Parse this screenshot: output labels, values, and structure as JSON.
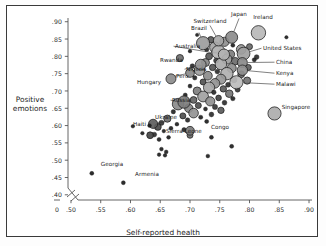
{
  "chart_data": {
    "type": "scatter",
    "title": "",
    "xlabel": "Self-reported health",
    "ylabel": "Positive emotions",
    "ylabel_line1": "Positive",
    "ylabel_line2": "emotions",
    "xlim": [
      0.485,
      0.905
    ],
    "ylim": [
      0.385,
      0.905
    ],
    "xticks": [
      "0",
      ".50",
      ".55",
      ".60",
      ".65",
      ".70",
      ".75",
      ".80",
      ".85",
      ".90"
    ],
    "xtick_values": [
      0.0,
      0.5,
      0.55,
      0.6,
      0.65,
      0.7,
      0.75,
      0.8,
      0.85,
      0.9
    ],
    "yticks": [
      ".90",
      ".85",
      ".80",
      ".75",
      ".70",
      ".65",
      ".60",
      ".55",
      ".50",
      ".45",
      ".40"
    ],
    "ytick_values": [
      0.9,
      0.85,
      0.8,
      0.75,
      0.7,
      0.65,
      0.6,
      0.55,
      0.5,
      0.45,
      0.4
    ],
    "grid": false,
    "legend": "none",
    "axis_break": true,
    "axis_break_note": "double-slash break between 0 and .50 on x axis",
    "marker_encoding": "bubble size encodes population; fill grayscale",
    "labeled_points": [
      {
        "name": "Ireland",
        "x": 0.815,
        "y": 0.868,
        "r": 7.2,
        "fill": "#b9b9b9",
        "lx": 263,
        "ly": 14,
        "lanchor": "center",
        "leader": false
      },
      {
        "name": "Japan",
        "x": 0.77,
        "y": 0.855,
        "r": 6.0,
        "fill": "#8d8d8d",
        "lx": 239,
        "ly": 11,
        "lanchor": "center",
        "leader": true
      },
      {
        "name": "Switzerland",
        "x": 0.748,
        "y": 0.845,
        "r": 5.2,
        "fill": "#a8a8a8",
        "lx": 210,
        "ly": 18,
        "lanchor": "center",
        "leader": true
      },
      {
        "name": "Brazil",
        "x": 0.722,
        "y": 0.838,
        "r": 6.6,
        "fill": "#9c9c9c",
        "lx": 199,
        "ly": 25,
        "lanchor": "center",
        "leader": true
      },
      {
        "name": "Australia",
        "x": 0.757,
        "y": 0.805,
        "r": 5.6,
        "fill": "#b2b2b2",
        "lx": 175,
        "ly": 43,
        "lanchor": "left",
        "leader": true
      },
      {
        "name": "United States",
        "x": 0.79,
        "y": 0.808,
        "r": 6.4,
        "fill": "#a0a0a0",
        "lx": 263,
        "ly": 45,
        "lanchor": "left",
        "leader": true
      },
      {
        "name": "China",
        "x": 0.788,
        "y": 0.782,
        "r": 5.0,
        "fill": "#8a8a8a",
        "lx": 276,
        "ly": 59,
        "lanchor": "left",
        "leader": true
      },
      {
        "name": "Rwanda",
        "x": 0.683,
        "y": 0.795,
        "r": 3.6,
        "fill": "#6f6f6f",
        "lx": 160,
        "ly": 57,
        "lanchor": "left",
        "leader": false
      },
      {
        "name": "Nigeria",
        "x": 0.718,
        "y": 0.776,
        "r": 5.4,
        "fill": "#949494",
        "lx": 186,
        "ly": 66,
        "lanchor": "left",
        "leader": true
      },
      {
        "name": "Kenya",
        "x": 0.788,
        "y": 0.76,
        "r": 5.2,
        "fill": "#8f8f8f",
        "lx": 276,
        "ly": 70,
        "lanchor": "left",
        "leader": true
      },
      {
        "name": "Peru",
        "x": 0.7,
        "y": 0.752,
        "r": 4.4,
        "fill": "#8a8a8a",
        "lx": 176,
        "ly": 73,
        "lanchor": "left",
        "leader": true
      },
      {
        "name": "Hungary",
        "x": 0.668,
        "y": 0.735,
        "r": 5.0,
        "fill": "#8c8c8c",
        "lx": 137,
        "ly": 79,
        "lanchor": "left",
        "leader": false
      },
      {
        "name": "Malawi",
        "x": 0.778,
        "y": 0.725,
        "r": 6.6,
        "fill": "#bdbdbd",
        "lx": 276,
        "ly": 81,
        "lanchor": "left",
        "leader": true
      },
      {
        "name": "Russia",
        "x": 0.69,
        "y": 0.668,
        "r": 6.2,
        "fill": "#7d7d7d",
        "lx": 172,
        "ly": 97,
        "lanchor": "left",
        "leader": true
      },
      {
        "name": "Singapore",
        "x": 0.842,
        "y": 0.635,
        "r": 6.6,
        "fill": "#adadad",
        "lx": 296,
        "ly": 104,
        "lanchor": "center",
        "leader": false
      },
      {
        "name": "Ukraine",
        "x": 0.638,
        "y": 0.605,
        "r": 4.6,
        "fill": "#5d5d5d",
        "lx": 166,
        "ly": 114,
        "lanchor": "center",
        "leader": true
      },
      {
        "name": "Haiti",
        "x": 0.632,
        "y": 0.6,
        "r": 1.9,
        "fill": "#1a1a1a",
        "lx": 133,
        "ly": 121,
        "lanchor": "left",
        "leader": false
      },
      {
        "name": "Congo",
        "x": 0.7,
        "y": 0.585,
        "r": 4.4,
        "fill": "#7a7a7a",
        "lx": 211,
        "ly": 124,
        "lanchor": "left",
        "leader": false
      },
      {
        "name": "Sierra Leone",
        "x": 0.633,
        "y": 0.572,
        "r": 3.4,
        "fill": "#444444",
        "lx": 166,
        "ly": 128,
        "lanchor": "left",
        "leader": false
      },
      {
        "name": "Georgia",
        "x": 0.535,
        "y": 0.462,
        "r": 2.0,
        "fill": "#1a1a1a",
        "lx": 112,
        "ly": 161,
        "lanchor": "center",
        "leader": false
      },
      {
        "name": "Armenia",
        "x": 0.588,
        "y": 0.435,
        "r": 2.0,
        "fill": "#1a1a1a",
        "lx": 147,
        "ly": 171,
        "lanchor": "center",
        "leader": false
      }
    ],
    "unlabeled_points": [
      {
        "x": 0.712,
        "y": 0.862,
        "r": 1.7,
        "fill": "#1e1e1e"
      },
      {
        "x": 0.862,
        "y": 0.855,
        "r": 1.7,
        "fill": "#1e1e1e"
      },
      {
        "x": 0.735,
        "y": 0.848,
        "r": 3.2,
        "fill": "#5a5a5a"
      },
      {
        "x": 0.758,
        "y": 0.842,
        "r": 4.6,
        "fill": "#909090"
      },
      {
        "x": 0.772,
        "y": 0.832,
        "r": 2.0,
        "fill": "#1e1e1e"
      },
      {
        "x": 0.742,
        "y": 0.826,
        "r": 5.4,
        "fill": "#a5a5a5"
      },
      {
        "x": 0.8,
        "y": 0.828,
        "r": 3.0,
        "fill": "#6a6a6a"
      },
      {
        "x": 0.728,
        "y": 0.82,
        "r": 2.2,
        "fill": "#2a2a2a"
      },
      {
        "x": 0.786,
        "y": 0.82,
        "r": 4.8,
        "fill": "#9a9a9a"
      },
      {
        "x": 0.7,
        "y": 0.815,
        "r": 1.8,
        "fill": "#1e1e1e"
      },
      {
        "x": 0.748,
        "y": 0.812,
        "r": 6.8,
        "fill": "#b5b5b5"
      },
      {
        "x": 0.768,
        "y": 0.806,
        "r": 4.2,
        "fill": "#7e7e7e"
      },
      {
        "x": 0.732,
        "y": 0.8,
        "r": 3.4,
        "fill": "#575757"
      },
      {
        "x": 0.812,
        "y": 0.798,
        "r": 2.4,
        "fill": "#2e2e2e"
      },
      {
        "x": 0.762,
        "y": 0.792,
        "r": 5.0,
        "fill": "#9d9d9d"
      },
      {
        "x": 0.744,
        "y": 0.788,
        "r": 2.6,
        "fill": "#3a3a3a"
      },
      {
        "x": 0.776,
        "y": 0.786,
        "r": 3.8,
        "fill": "#6d6d6d"
      },
      {
        "x": 0.808,
        "y": 0.79,
        "r": 2.1,
        "fill": "#1e1e1e"
      },
      {
        "x": 0.726,
        "y": 0.782,
        "r": 4.0,
        "fill": "#888888"
      },
      {
        "x": 0.752,
        "y": 0.778,
        "r": 5.8,
        "fill": "#aaaaaa"
      },
      {
        "x": 0.704,
        "y": 0.772,
        "r": 2.3,
        "fill": "#2a2a2a"
      },
      {
        "x": 0.738,
        "y": 0.768,
        "r": 3.2,
        "fill": "#565656"
      },
      {
        "x": 0.77,
        "y": 0.766,
        "r": 4.6,
        "fill": "#8e8e8e"
      },
      {
        "x": 0.798,
        "y": 0.768,
        "r": 3.0,
        "fill": "#606060"
      },
      {
        "x": 0.716,
        "y": 0.76,
        "r": 5.2,
        "fill": "#9e9e9e"
      },
      {
        "x": 0.746,
        "y": 0.756,
        "r": 2.4,
        "fill": "#2e2e2e"
      },
      {
        "x": 0.762,
        "y": 0.75,
        "r": 6.2,
        "fill": "#b0b0b0"
      },
      {
        "x": 0.786,
        "y": 0.748,
        "r": 3.4,
        "fill": "#666666"
      },
      {
        "x": 0.73,
        "y": 0.744,
        "r": 4.4,
        "fill": "#8c8c8c"
      },
      {
        "x": 0.708,
        "y": 0.738,
        "r": 2.2,
        "fill": "#242424"
      },
      {
        "x": 0.752,
        "y": 0.734,
        "r": 5.0,
        "fill": "#989898"
      },
      {
        "x": 0.774,
        "y": 0.732,
        "r": 2.8,
        "fill": "#444444"
      },
      {
        "x": 0.796,
        "y": 0.73,
        "r": 3.6,
        "fill": "#737373"
      },
      {
        "x": 0.722,
        "y": 0.726,
        "r": 3.0,
        "fill": "#535353"
      },
      {
        "x": 0.742,
        "y": 0.722,
        "r": 4.8,
        "fill": "#939393"
      },
      {
        "x": 0.764,
        "y": 0.718,
        "r": 2.5,
        "fill": "#303030"
      },
      {
        "x": 0.7,
        "y": 0.714,
        "r": 2.0,
        "fill": "#1e1e1e"
      },
      {
        "x": 0.732,
        "y": 0.71,
        "r": 5.6,
        "fill": "#a6a6a6"
      },
      {
        "x": 0.756,
        "y": 0.706,
        "r": 3.2,
        "fill": "#5c5c5c"
      },
      {
        "x": 0.78,
        "y": 0.704,
        "r": 2.6,
        "fill": "#383838"
      },
      {
        "x": 0.712,
        "y": 0.7,
        "r": 4.0,
        "fill": "#7f7f7f"
      },
      {
        "x": 0.74,
        "y": 0.696,
        "r": 2.3,
        "fill": "#282828"
      },
      {
        "x": 0.766,
        "y": 0.692,
        "r": 3.8,
        "fill": "#767676"
      },
      {
        "x": 0.692,
        "y": 0.688,
        "r": 2.1,
        "fill": "#1e1e1e"
      },
      {
        "x": 0.722,
        "y": 0.684,
        "r": 5.4,
        "fill": "#a1a1a1"
      },
      {
        "x": 0.748,
        "y": 0.68,
        "r": 2.8,
        "fill": "#414141"
      },
      {
        "x": 0.772,
        "y": 0.678,
        "r": 2.2,
        "fill": "#242424"
      },
      {
        "x": 0.706,
        "y": 0.674,
        "r": 3.4,
        "fill": "#636363"
      },
      {
        "x": 0.734,
        "y": 0.67,
        "r": 4.6,
        "fill": "#8f8f8f"
      },
      {
        "x": 0.758,
        "y": 0.666,
        "r": 2.4,
        "fill": "#2c2c2c"
      },
      {
        "x": 0.68,
        "y": 0.662,
        "r": 5.8,
        "fill": "#8b8b8b"
      },
      {
        "x": 0.714,
        "y": 0.658,
        "r": 3.0,
        "fill": "#505050"
      },
      {
        "x": 0.742,
        "y": 0.654,
        "r": 2.6,
        "fill": "#363636"
      },
      {
        "x": 0.698,
        "y": 0.65,
        "r": 4.2,
        "fill": "#848484"
      },
      {
        "x": 0.726,
        "y": 0.648,
        "r": 2.0,
        "fill": "#1e1e1e"
      },
      {
        "x": 0.752,
        "y": 0.644,
        "r": 3.2,
        "fill": "#5a5a5a"
      },
      {
        "x": 0.672,
        "y": 0.64,
        "r": 2.2,
        "fill": "#242424"
      },
      {
        "x": 0.706,
        "y": 0.636,
        "r": 4.8,
        "fill": "#949494"
      },
      {
        "x": 0.736,
        "y": 0.632,
        "r": 2.4,
        "fill": "#2c2c2c"
      },
      {
        "x": 0.688,
        "y": 0.628,
        "r": 3.0,
        "fill": "#4e4e4e"
      },
      {
        "x": 0.718,
        "y": 0.624,
        "r": 2.1,
        "fill": "#1e1e1e"
      },
      {
        "x": 0.662,
        "y": 0.62,
        "r": 3.6,
        "fill": "#6e6e6e"
      },
      {
        "x": 0.696,
        "y": 0.616,
        "r": 2.3,
        "fill": "#282828"
      },
      {
        "x": 0.728,
        "y": 0.612,
        "r": 2.0,
        "fill": "#1e1e1e"
      },
      {
        "x": 0.652,
        "y": 0.608,
        "r": 2.6,
        "fill": "#343434"
      },
      {
        "x": 0.678,
        "y": 0.604,
        "r": 1.9,
        "fill": "#1e1e1e"
      },
      {
        "x": 0.646,
        "y": 0.596,
        "r": 3.4,
        "fill": "#4a4a4a"
      },
      {
        "x": 0.668,
        "y": 0.592,
        "r": 2.0,
        "fill": "#1e1e1e"
      },
      {
        "x": 0.69,
        "y": 0.588,
        "r": 2.2,
        "fill": "#242424"
      },
      {
        "x": 0.656,
        "y": 0.584,
        "r": 1.8,
        "fill": "#1e1e1e"
      },
      {
        "x": 0.62,
        "y": 0.578,
        "r": 1.8,
        "fill": "#1e1e1e"
      },
      {
        "x": 0.64,
        "y": 0.574,
        "r": 2.4,
        "fill": "#2c2c2c"
      },
      {
        "x": 0.7,
        "y": 0.572,
        "r": 3.0,
        "fill": "#6a6a6a"
      },
      {
        "x": 0.664,
        "y": 0.566,
        "r": 1.9,
        "fill": "#1e1e1e"
      },
      {
        "x": 0.648,
        "y": 0.56,
        "r": 2.0,
        "fill": "#1e1e1e"
      },
      {
        "x": 0.736,
        "y": 0.566,
        "r": 2.0,
        "fill": "#1e1e1e"
      },
      {
        "x": 0.77,
        "y": 0.54,
        "r": 2.0,
        "fill": "#1e1e1e"
      },
      {
        "x": 0.652,
        "y": 0.532,
        "r": 1.9,
        "fill": "#1e1e1e"
      },
      {
        "x": 0.66,
        "y": 0.524,
        "r": 1.9,
        "fill": "#1e1e1e"
      },
      {
        "x": 0.648,
        "y": 0.516,
        "r": 1.8,
        "fill": "#1e1e1e"
      },
      {
        "x": 0.658,
        "y": 0.514,
        "r": 1.8,
        "fill": "#1e1e1e"
      },
      {
        "x": 0.73,
        "y": 0.512,
        "r": 1.9,
        "fill": "#1e1e1e"
      },
      {
        "x": 0.604,
        "y": 0.598,
        "r": 1.8,
        "fill": "#1e1e1e"
      }
    ]
  }
}
